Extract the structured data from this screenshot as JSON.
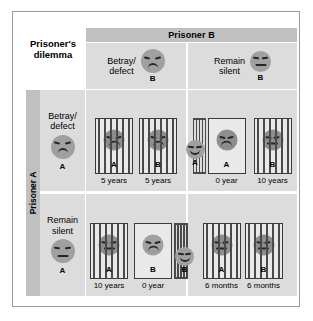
{
  "figure": {
    "title": "Prisoner's dilemma",
    "column_axis_label": "Prisoner B",
    "row_axis_label": "Prisoner A"
  },
  "columns": [
    {
      "id": "betray",
      "label": "Betray/\ndefect",
      "actor_tag": "B",
      "face": "sad"
    },
    {
      "id": "silent",
      "label": "Remain\nsilent",
      "actor_tag": "B",
      "face": "neutral"
    }
  ],
  "rows": [
    {
      "id": "betray",
      "label": "Betray/\ndefect",
      "actor_tag": "A",
      "face": "sad"
    },
    {
      "id": "silent",
      "label": "Remain\nsilent",
      "actor_tag": "A",
      "face": "neutral"
    }
  ],
  "cells": {
    "betray_betray": {
      "a": {
        "tag": "A",
        "sentence": "5 years",
        "state": "jailed",
        "face": "sad"
      },
      "b": {
        "tag": "B",
        "sentence": "5 years",
        "state": "jailed",
        "face": "sad"
      }
    },
    "betray_silent": {
      "a": {
        "tag": "A",
        "sentence": "0 year",
        "state": "free",
        "face": "sad",
        "free_face": "happy",
        "free_tag": "A"
      },
      "b": {
        "tag": "B",
        "sentence": "10 years",
        "state": "jailed",
        "face": "neutral"
      }
    },
    "silent_betray": {
      "a": {
        "tag": "A",
        "sentence": "10 years",
        "state": "jailed",
        "face": "neutral"
      },
      "b": {
        "tag": "B",
        "sentence": "0 year",
        "state": "free",
        "face": "sad",
        "free_face": "happy",
        "free_tag": "B"
      }
    },
    "silent_silent": {
      "a": {
        "tag": "A",
        "sentence": "6 months",
        "state": "jailed",
        "face": "neutral"
      },
      "b": {
        "tag": "B",
        "sentence": "6 months",
        "state": "jailed",
        "face": "neutral"
      }
    }
  },
  "colors": {
    "panel": "#dcdcdc",
    "header_bar": "#c0c0c0",
    "page": "#ffffff",
    "ink": "#262626",
    "bars": "#4a4a4a",
    "face": "#a0a0a0"
  }
}
